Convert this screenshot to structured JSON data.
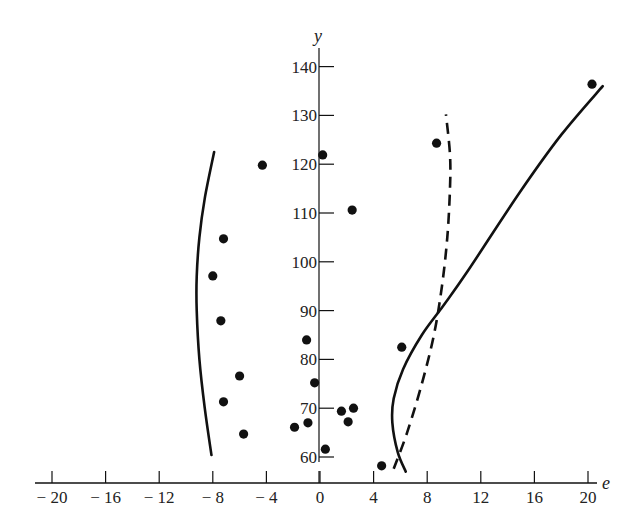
{
  "chart_data": {
    "type": "scatter",
    "title": "",
    "xlabel": "e",
    "ylabel": "y",
    "xlim": [
      -22,
      22
    ],
    "ylim": [
      57,
      145
    ],
    "x_ticks": [
      -20,
      -16,
      -12,
      -8,
      -4,
      0,
      4,
      8,
      12,
      16,
      20
    ],
    "x_tick_labels": [
      "− 20",
      "− 16",
      "− 12",
      "− 8",
      "− 4",
      "0",
      "4",
      "8",
      "12",
      "16",
      "20"
    ],
    "y_ticks": [
      60,
      70,
      80,
      90,
      100,
      110,
      120,
      130,
      140
    ],
    "y_tick_labels": [
      "60",
      "70",
      "80",
      "90",
      "100",
      "110",
      "120",
      "130",
      "140"
    ],
    "grid": false,
    "legend": null,
    "series": [
      {
        "name": "observations",
        "kind": "points",
        "points": [
          {
            "e": -4.3,
            "y": 119.8
          },
          {
            "e": -7.2,
            "y": 104.7
          },
          {
            "e": -8.0,
            "y": 97.1
          },
          {
            "e": -7.4,
            "y": 87.9
          },
          {
            "e": -6.0,
            "y": 76.6
          },
          {
            "e": -7.2,
            "y": 71.3
          },
          {
            "e": -5.7,
            "y": 64.7
          },
          {
            "e": 0.2,
            "y": 121.9
          },
          {
            "e": 2.4,
            "y": 110.6
          },
          {
            "e": -1.0,
            "y": 84.0
          },
          {
            "e": -0.4,
            "y": 75.2
          },
          {
            "e": -1.9,
            "y": 66.1
          },
          {
            "e": -0.9,
            "y": 67.0
          },
          {
            "e": 0.4,
            "y": 61.6
          },
          {
            "e": 1.6,
            "y": 69.4
          },
          {
            "e": 2.5,
            "y": 70.0
          },
          {
            "e": 2.1,
            "y": 67.2
          },
          {
            "e": 4.6,
            "y": 58.2
          },
          {
            "e": 6.1,
            "y": 82.5
          },
          {
            "e": 8.7,
            "y": 124.3
          },
          {
            "e": 20.3,
            "y": 136.4
          }
        ]
      },
      {
        "name": "left-solid-curve",
        "kind": "curve",
        "style": "solid",
        "points": [
          {
            "e": -8.1,
            "y": 60.4
          },
          {
            "e": -8.6,
            "y": 70
          },
          {
            "e": -9.0,
            "y": 80
          },
          {
            "e": -9.2,
            "y": 90
          },
          {
            "e": -9.2,
            "y": 97
          },
          {
            "e": -9.0,
            "y": 105
          },
          {
            "e": -8.6,
            "y": 113
          },
          {
            "e": -7.9,
            "y": 122.5
          }
        ]
      },
      {
        "name": "right-solid-curve",
        "kind": "curve",
        "style": "solid",
        "points": [
          {
            "e": 6.4,
            "y": 57.0
          },
          {
            "e": 5.8,
            "y": 61
          },
          {
            "e": 5.4,
            "y": 67
          },
          {
            "e": 5.5,
            "y": 72
          },
          {
            "e": 6.2,
            "y": 78
          },
          {
            "e": 7.6,
            "y": 85
          },
          {
            "e": 9.2,
            "y": 91
          },
          {
            "e": 11.0,
            "y": 98
          },
          {
            "e": 14.9,
            "y": 114.2
          },
          {
            "e": 18.0,
            "y": 126
          },
          {
            "e": 21.1,
            "y": 136.0
          }
        ]
      },
      {
        "name": "right-dashed-curve",
        "kind": "curve",
        "style": "dashed",
        "points": [
          {
            "e": 5.5,
            "y": 57.6
          },
          {
            "e": 6.5,
            "y": 65
          },
          {
            "e": 7.6,
            "y": 75
          },
          {
            "e": 8.5,
            "y": 85
          },
          {
            "e": 9.1,
            "y": 95
          },
          {
            "e": 9.5,
            "y": 105
          },
          {
            "e": 9.7,
            "y": 115
          },
          {
            "e": 9.7,
            "y": 122
          },
          {
            "e": 9.4,
            "y": 130.2
          }
        ]
      }
    ]
  },
  "layout": {
    "x_axis_y_px": 483,
    "x_zero_px": 320,
    "x_px_per_unit": 13.4,
    "y_axis_x_px": 319,
    "y60_px": 457,
    "y_px_per_unit": 4.88,
    "y_axis_top_px": 48,
    "y_axis_bottom_px": 462,
    "x_axis_left_px": 35,
    "x_axis_right_px": 597,
    "ink": "#111111"
  }
}
